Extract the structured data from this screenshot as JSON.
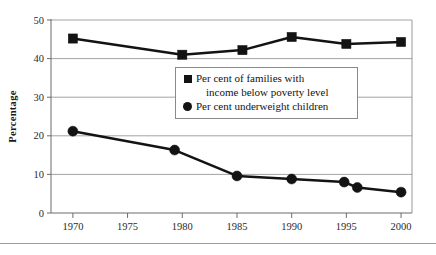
{
  "chart_data": {
    "type": "line",
    "title": "",
    "subtitle": "",
    "xlabel": "",
    "ylabel": "Percentage",
    "xlim": [
      1968,
      2001
    ],
    "ylim": [
      0,
      50
    ],
    "grid": true,
    "grid_axis": "y",
    "legend_position": "center",
    "xticks": [
      "1970",
      "1975",
      "1980",
      "1985",
      "1990",
      "1995",
      "2000"
    ],
    "xtick_values": [
      1970,
      1975,
      1980,
      1985,
      1990,
      1995,
      2000
    ],
    "yticks": [
      "0",
      "10",
      "20",
      "30",
      "40",
      "50"
    ],
    "ytick_values": [
      0,
      10,
      20,
      30,
      40,
      50
    ],
    "series": [
      {
        "name": "Per cent of families with income below poverty level",
        "legend_line1": "Per cent of families with",
        "legend_line2": "income below poverty level",
        "marker": "square",
        "color": "#131313",
        "x": [
          1970,
          1980,
          1985.5,
          1990,
          1995,
          2000
        ],
        "values": [
          45.2,
          41.0,
          42.2,
          45.6,
          43.8,
          44.3
        ]
      },
      {
        "name": "Per cent underweight children",
        "legend_line1": "Per cent underweight children",
        "legend_line2": "",
        "marker": "circle",
        "color": "#131313",
        "x": [
          1970,
          1979.3,
          1985,
          1990,
          1994.8,
          1996,
          2000
        ],
        "values": [
          21.2,
          16.3,
          9.6,
          8.8,
          8.0,
          6.6,
          5.4
        ]
      }
    ]
  },
  "legend": {
    "items": [
      {
        "marker": "square",
        "line1": "Per cent of families with",
        "line2": "income below poverty level"
      },
      {
        "marker": "circle",
        "line1": "Per cent underweight children",
        "line2": ""
      }
    ]
  }
}
